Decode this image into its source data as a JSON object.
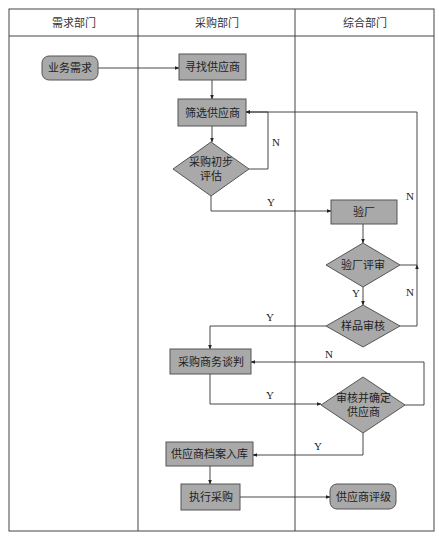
{
  "diagram": {
    "type": "swimlane-flowchart",
    "frame": {
      "x": 9,
      "y": 9,
      "w": 425,
      "h": 522,
      "header_h": 27
    },
    "colors": {
      "node_fill": "#a9a9a9",
      "node_stroke": "#555555",
      "line": "#333333",
      "background": "#ffffff"
    },
    "lanes": [
      {
        "id": "demand",
        "title": "需求部门",
        "x0": 9,
        "x1": 138
      },
      {
        "id": "purchasing",
        "title": "采购部门",
        "x0": 138,
        "x1": 295
      },
      {
        "id": "general",
        "title": "综合部门",
        "x0": 295,
        "x1": 434
      }
    ],
    "nodes": [
      {
        "id": "n1",
        "label": [
          "业务需求"
        ],
        "shape": "rounded",
        "lane": "demand",
        "x": 42,
        "y": 56,
        "w": 56,
        "h": 24
      },
      {
        "id": "n2",
        "label": [
          "寻找供应商"
        ],
        "shape": "rect",
        "lane": "purchasing",
        "x": 179,
        "y": 54,
        "w": 67,
        "h": 26
      },
      {
        "id": "n3",
        "label": [
          "筛选供应商"
        ],
        "shape": "rect",
        "lane": "purchasing",
        "x": 178,
        "y": 99,
        "w": 68,
        "h": 27
      },
      {
        "id": "n4",
        "label": [
          "采购初步",
          "评估"
        ],
        "shape": "diamond",
        "lane": "purchasing",
        "cx": 211,
        "cy": 169,
        "w": 76,
        "h": 54
      },
      {
        "id": "n5",
        "label": [
          "验厂"
        ],
        "shape": "rect",
        "lane": "general",
        "x": 331,
        "y": 200,
        "w": 66,
        "h": 24
      },
      {
        "id": "n6",
        "label": [
          "验厂评审"
        ],
        "shape": "diamond",
        "lane": "general",
        "cx": 363,
        "cy": 265,
        "w": 74,
        "h": 44
      },
      {
        "id": "n7",
        "label": [
          "样品审核"
        ],
        "shape": "diamond",
        "lane": "general",
        "cx": 363,
        "cy": 326,
        "w": 74,
        "h": 42
      },
      {
        "id": "n8",
        "label": [
          "采购商务谈判"
        ],
        "shape": "rect",
        "lane": "purchasing",
        "x": 170,
        "y": 349,
        "w": 81,
        "h": 25
      },
      {
        "id": "n9",
        "label": [
          "审核并确定",
          "供应商"
        ],
        "shape": "diamond",
        "lane": "general",
        "cx": 363,
        "cy": 405,
        "w": 84,
        "h": 56
      },
      {
        "id": "n10",
        "label": [
          "供应商档案入库"
        ],
        "shape": "rect",
        "lane": "purchasing",
        "x": 166,
        "y": 442,
        "w": 87,
        "h": 24
      },
      {
        "id": "n11",
        "label": [
          "执行采购"
        ],
        "shape": "rect",
        "lane": "purchasing",
        "x": 181,
        "y": 484,
        "w": 59,
        "h": 26
      },
      {
        "id": "n12",
        "label": [
          "供应商评级"
        ],
        "shape": "rounded",
        "lane": "general",
        "x": 330,
        "y": 484,
        "w": 66,
        "h": 25
      }
    ],
    "edges": [
      {
        "from": "n1",
        "to": "n2",
        "label": "",
        "points": [
          [
            98,
            68
          ],
          [
            179,
            68
          ]
        ]
      },
      {
        "from": "n2",
        "to": "n3",
        "label": "",
        "points": [
          [
            212,
            80
          ],
          [
            212,
            99
          ]
        ]
      },
      {
        "from": "n3",
        "to": "n4",
        "label": "",
        "points": [
          [
            212,
            126
          ],
          [
            212,
            142
          ]
        ]
      },
      {
        "from": "n4",
        "to": "n3",
        "label": "N",
        "points": [
          [
            249,
            169
          ],
          [
            268,
            169
          ],
          [
            268,
            112
          ],
          [
            246,
            112
          ]
        ],
        "label_pos": [
          276,
          146
        ]
      },
      {
        "from": "n4",
        "to": "n5",
        "label": "Y",
        "points": [
          [
            211,
            196
          ],
          [
            211,
            211
          ],
          [
            331,
            211
          ]
        ],
        "label_pos": [
          271,
          206
        ]
      },
      {
        "from": "n5",
        "to": "n6",
        "label": "",
        "points": [
          [
            363,
            224
          ],
          [
            363,
            243
          ]
        ]
      },
      {
        "from": "n6",
        "to": "n3",
        "label": "N",
        "points": [
          [
            400,
            265
          ],
          [
            417,
            265
          ],
          [
            417,
            112
          ],
          [
            246,
            112
          ]
        ],
        "label_pos": [
          410,
          200
        ]
      },
      {
        "from": "n6",
        "to": "n7",
        "label": "Y",
        "points": [
          [
            363,
            287
          ],
          [
            363,
            305
          ]
        ],
        "label_pos": [
          356,
          297
        ]
      },
      {
        "from": "n7",
        "to": "n3",
        "label": "N",
        "points": [
          [
            400,
            326
          ],
          [
            417,
            326
          ],
          [
            417,
            265
          ]
        ],
        "label_pos": [
          410,
          296
        ]
      },
      {
        "from": "n7",
        "to": "n8",
        "label": "Y",
        "points": [
          [
            326,
            326
          ],
          [
            210,
            326
          ],
          [
            210,
            349
          ]
        ],
        "label_pos": [
          270,
          321
        ]
      },
      {
        "from": "n8",
        "to": "n9",
        "label": "Y",
        "points": [
          [
            210,
            374
          ],
          [
            210,
            404
          ],
          [
            321,
            404
          ]
        ],
        "label_pos": [
          270,
          399
        ]
      },
      {
        "from": "n9",
        "to": "n8",
        "label": "N",
        "points": [
          [
            405,
            405
          ],
          [
            424,
            405
          ],
          [
            424,
            362
          ],
          [
            251,
            362
          ]
        ],
        "label_pos": [
          329,
          358
        ]
      },
      {
        "from": "n9",
        "to": "n10",
        "label": "Y",
        "points": [
          [
            363,
            433
          ],
          [
            363,
            455
          ],
          [
            253,
            455
          ]
        ],
        "label_pos": [
          318,
          450
        ]
      },
      {
        "from": "n10",
        "to": "n11",
        "label": "",
        "points": [
          [
            210,
            466
          ],
          [
            210,
            484
          ]
        ]
      },
      {
        "from": "n11",
        "to": "n12",
        "label": "",
        "points": [
          [
            240,
            497
          ],
          [
            330,
            497
          ]
        ]
      }
    ]
  }
}
